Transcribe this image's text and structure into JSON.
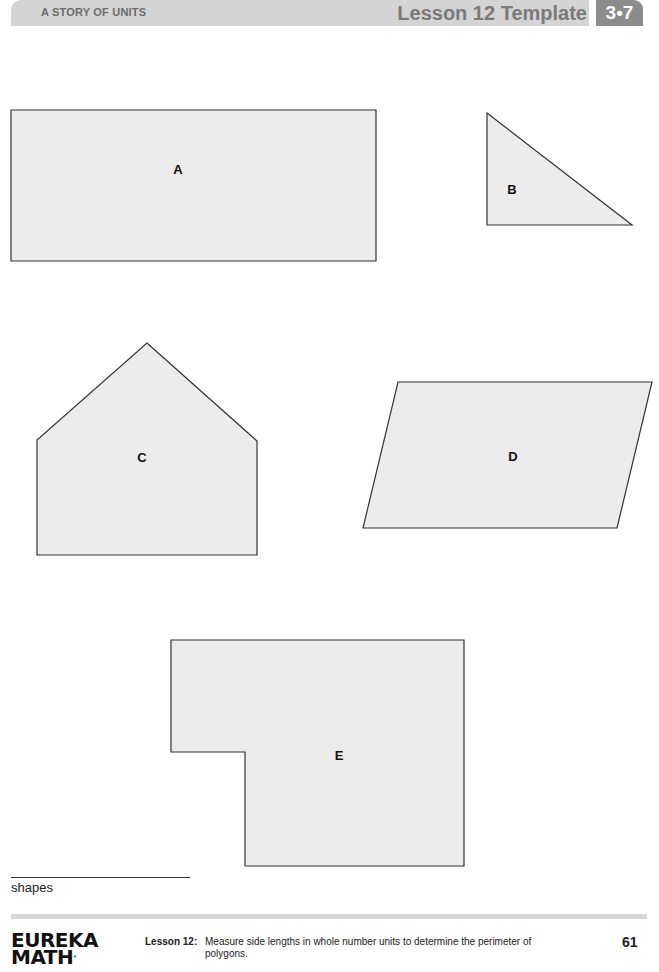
{
  "header": {
    "series": "A STORY OF UNITS",
    "title": "Lesson 12 Template",
    "badge": "3•7"
  },
  "colors": {
    "header_bar": "#d4d4d4",
    "header_badge": "#8c8c8c",
    "shape_fill": "#ececec",
    "shape_stroke": "#333333"
  },
  "shapes": [
    {
      "id": "A",
      "label": "A",
      "type": "rectangle",
      "points": "11,110 376,110 376,261 11,261",
      "label_x": 178,
      "label_y": 169
    },
    {
      "id": "B",
      "label": "B",
      "type": "right-triangle",
      "points": "487,113 632,225 487,225",
      "label_x": 512,
      "label_y": 189
    },
    {
      "id": "C",
      "label": "C",
      "type": "pentagon",
      "points": "147,343 257,441 257,555 37,555 37,440",
      "label_x": 142,
      "label_y": 457
    },
    {
      "id": "D",
      "label": "D",
      "type": "parallelogram",
      "points": "398,382 652,382 617,528 363,528",
      "label_x": 513,
      "label_y": 456
    },
    {
      "id": "E",
      "label": "E",
      "type": "l-shape",
      "points": "171,640 464,640 464,866 245,866 245,752 171,752",
      "label_x": 339,
      "label_y": 755
    }
  ],
  "caption": "shapes",
  "footer": {
    "logo_line1": "EUREKA",
    "logo_line2": "MATH",
    "logo_mark": "°",
    "lesson_label": "Lesson 12:",
    "lesson_description": "Measure side lengths in whole number units to determine the perimeter of polygons.",
    "page_number": "61"
  }
}
